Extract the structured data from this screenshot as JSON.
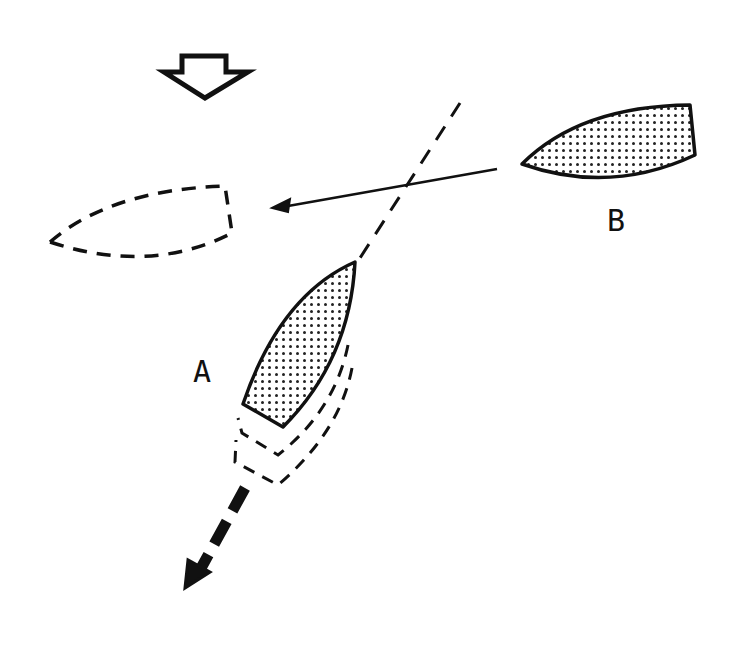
{
  "diagram": {
    "type": "sailing-rules-illustration",
    "wind_indicator": {
      "icon": "wind-direction-arrow-icon",
      "direction": "down"
    },
    "boats": [
      {
        "id": "A",
        "label": "A",
        "state": "current",
        "fill": "dotted",
        "heading": "north-east",
        "ghost_positions": 2,
        "motion": "backing down (thick dashed arrow to south-west)"
      },
      {
        "id": "B",
        "label": "B",
        "state": "current",
        "fill": "dotted",
        "heading": "west"
      },
      {
        "id": "B-future",
        "label": "",
        "state": "projected",
        "fill": "none",
        "outline": "dashed"
      }
    ],
    "lines": [
      {
        "name": "course-line-B",
        "style": "solid",
        "arrow": "to projected position of B"
      },
      {
        "name": "centerline-extension-A",
        "style": "dashed"
      },
      {
        "name": "sternway-arrow-A",
        "style": "thick-dashed",
        "arrow": "south-west"
      }
    ],
    "labels": {
      "boat_a": "A",
      "boat_b": "B"
    },
    "colors": {
      "ink": "#111111",
      "background": "#ffffff"
    }
  }
}
